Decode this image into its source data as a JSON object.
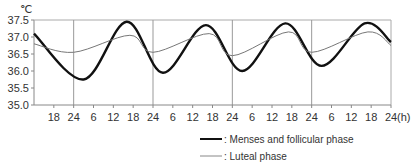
{
  "chart_data": {
    "type": "line",
    "title": "",
    "ylabel": "℃",
    "xlabel": "(h)",
    "ylim": [
      35.0,
      37.5
    ],
    "yticks": [
      "35.0",
      "35.5",
      "36.0",
      "36.5",
      "37.0",
      "37.5"
    ],
    "x_range_hours": [
      12,
      120
    ],
    "xtick_labels": [
      "18",
      "24",
      "6",
      "12",
      "18",
      "24",
      "6",
      "12",
      "18",
      "24",
      "6",
      "12",
      "18",
      "24",
      "6",
      "12",
      "18",
      "24"
    ],
    "x_unit_label": "(h)",
    "day_boundaries_hours": [
      24,
      48,
      72,
      96,
      120
    ],
    "grid": "vertical lines at each 24h",
    "series": [
      {
        "name": "Menses and follicular phase",
        "legend_label": ": Menses and follicular phase",
        "style": "thick",
        "color": "#111111",
        "mean": 36.6,
        "amplitude": 0.82,
        "period_h": 24,
        "peak_hour": 16,
        "points": [
          [
            12,
            37.1
          ],
          [
            27,
            35.75
          ],
          [
            40,
            37.45
          ],
          [
            51,
            35.95
          ],
          [
            64,
            37.35
          ],
          [
            75,
            36.0
          ],
          [
            88,
            37.4
          ],
          [
            99,
            36.15
          ],
          [
            112,
            37.4
          ],
          [
            120,
            36.85
          ]
        ]
      },
      {
        "name": "Luteal phase",
        "legend_label": ": Luteal phase",
        "style": "thin",
        "color": "#777777",
        "mean": 36.8,
        "amplitude": 0.24,
        "period_h": 24,
        "peak_hour": 17,
        "points": [
          [
            12,
            36.8
          ],
          [
            24,
            36.55
          ],
          [
            41,
            37.05
          ],
          [
            48,
            36.55
          ],
          [
            65,
            37.1
          ],
          [
            72,
            36.45
          ],
          [
            89,
            37.15
          ],
          [
            96,
            36.55
          ],
          [
            113,
            37.15
          ],
          [
            120,
            36.75
          ]
        ]
      }
    ],
    "legend_position": "bottom-right"
  }
}
